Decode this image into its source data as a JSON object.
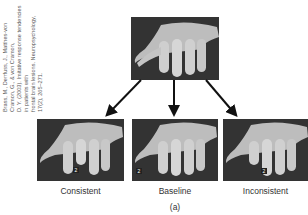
{
  "citation": {
    "line1": "Brass, M., Derrfuss, J., Matthes-von Cramon, G., & von Cramon,",
    "line2": "D. Y. (2003). Imitative response tendencies in patients with",
    "line3": "frontal brain lesions. Neuropsychology, 17(2), 265–271."
  },
  "figure": {
    "top_image": "hand-at-rest",
    "panels": [
      {
        "label": "Consistent",
        "finger_marker": "2"
      },
      {
        "label": "Baseline",
        "finger_marker": "2"
      },
      {
        "label": "Inconsistent",
        "finger_marker": "2"
      }
    ],
    "caption": "(a)"
  }
}
